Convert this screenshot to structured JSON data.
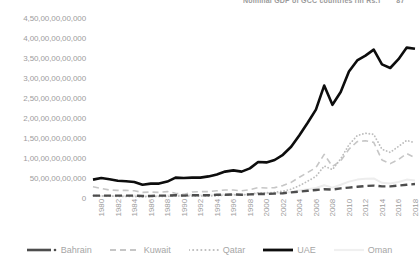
{
  "header": {
    "text": "Nominal GDP of GCC countries (in Rs.)",
    "page_number": "87"
  },
  "chart_data": {
    "type": "line",
    "title": "",
    "xlabel": "",
    "ylabel": "",
    "grid": false,
    "legend_position": "bottom",
    "ylim": [
      0,
      45000000000000
    ],
    "y_ticks": [
      "0",
      "50,00,00,00,000",
      "1,00,00,00,00,000",
      "1,50,00,00,00,000",
      "2,00,00,00,00,000",
      "2,50,00,00,00,000",
      "3,00,00,00,00,000",
      "3,50,00,00,00,000",
      "4,00,00,00,00,000",
      "4,50,00,00,00,000"
    ],
    "y_tick_values": [
      0,
      5,
      10,
      15,
      20,
      25,
      30,
      35,
      40,
      45
    ],
    "x": [
      1980,
      1981,
      1982,
      1983,
      1984,
      1985,
      1986,
      1987,
      1988,
      1989,
      1990,
      1991,
      1992,
      1993,
      1994,
      1995,
      1996,
      1997,
      1998,
      1999,
      2000,
      2001,
      2002,
      2003,
      2004,
      2005,
      2006,
      2007,
      2008,
      2009,
      2010,
      2011,
      2012,
      2013,
      2014,
      2015,
      2016,
      2017,
      2018,
      2019
    ],
    "x_ticks": [
      "1980",
      "1982",
      "1984",
      "1986",
      "1988",
      "1990",
      "1992",
      "1994",
      "1996",
      "1998",
      "2000",
      "2002",
      "2004",
      "2006",
      "2008",
      "2010",
      "2012",
      "2014",
      "2016",
      "2018"
    ],
    "series": [
      {
        "name": "Bahrain",
        "style": "dashed-dark",
        "color": "#4d4d4d",
        "values": [
          0.6,
          0.6,
          0.6,
          0.6,
          0.6,
          0.6,
          0.5,
          0.5,
          0.6,
          0.6,
          0.7,
          0.6,
          0.7,
          0.7,
          0.7,
          0.8,
          0.8,
          0.9,
          0.8,
          0.9,
          1.0,
          1.0,
          1.1,
          1.2,
          1.4,
          1.6,
          1.8,
          2.0,
          2.2,
          2.1,
          2.4,
          2.6,
          2.8,
          3.0,
          3.1,
          2.9,
          2.9,
          3.1,
          3.3,
          3.5
        ]
      },
      {
        "name": "Kuwait",
        "style": "dashed-light",
        "color": "#c6c6c6",
        "values": [
          2.8,
          2.4,
          2.0,
          1.9,
          1.9,
          1.8,
          1.4,
          1.5,
          1.4,
          1.6,
          1.2,
          0.9,
          1.5,
          1.6,
          1.6,
          1.8,
          2.0,
          2.0,
          1.8,
          2.1,
          2.6,
          2.5,
          2.6,
          3.1,
          3.9,
          5.2,
          6.4,
          7.6,
          10.9,
          7.9,
          9.3,
          12.2,
          14.1,
          14.3,
          13.9,
          9.5,
          8.6,
          9.6,
          11.1,
          10.1
        ]
      },
      {
        "name": "Qatar",
        "style": "dotted",
        "color": "#bdbdbd",
        "values": [
          0.6,
          0.5,
          0.5,
          0.4,
          0.4,
          0.4,
          0.3,
          0.4,
          0.4,
          0.4,
          0.5,
          0.5,
          0.5,
          0.5,
          0.5,
          0.6,
          0.7,
          0.8,
          0.8,
          0.9,
          1.3,
          1.3,
          1.4,
          1.7,
          2.2,
          3.1,
          4.2,
          5.4,
          8.0,
          7.1,
          9.8,
          13.3,
          15.6,
          16.2,
          15.9,
          12.2,
          11.4,
          12.9,
          14.4,
          13.8
        ]
      },
      {
        "name": "UAE",
        "style": "solid-thick",
        "color": "#0d0d0d",
        "values": [
          4.6,
          5.0,
          4.7,
          4.3,
          4.2,
          4.0,
          3.3,
          3.6,
          3.6,
          4.1,
          5.1,
          5.0,
          5.1,
          5.1,
          5.4,
          5.9,
          6.6,
          6.9,
          6.6,
          7.4,
          9.0,
          8.9,
          9.5,
          10.8,
          12.8,
          15.7,
          18.8,
          22.1,
          28.1,
          23.3,
          26.5,
          31.6,
          34.4,
          35.6,
          37.1,
          33.4,
          32.5,
          34.7,
          37.6,
          37.3
        ]
      },
      {
        "name": "Oman",
        "style": "solid-faint",
        "color": "#ededed",
        "values": [
          0.5,
          0.5,
          0.5,
          0.5,
          0.5,
          0.6,
          0.5,
          0.5,
          0.5,
          0.6,
          0.7,
          0.7,
          0.8,
          0.7,
          0.8,
          0.8,
          0.9,
          0.9,
          0.8,
          0.9,
          1.2,
          1.2,
          1.2,
          1.3,
          1.5,
          1.9,
          2.2,
          2.5,
          3.2,
          2.6,
          3.3,
          4.1,
          4.6,
          4.8,
          4.9,
          3.8,
          3.6,
          4.0,
          4.6,
          4.4
        ]
      }
    ]
  },
  "legend": [
    {
      "label": "Bahrain",
      "marker": "dashed-dark-with-dot"
    },
    {
      "label": "Kuwait",
      "marker": "dashed-light"
    },
    {
      "label": "Qatar",
      "marker": "dotted"
    },
    {
      "label": "UAE",
      "marker": "solid-thick"
    },
    {
      "label": "Oman",
      "marker": "solid-faint"
    }
  ]
}
